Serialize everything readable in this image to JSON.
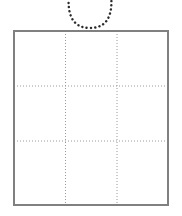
{
  "figure": {
    "type": "line-diagram",
    "title": "",
    "canvas": {
      "width": 182,
      "height": 216,
      "background": "#ffffff"
    },
    "elements": {
      "square": {
        "name": "Square outline",
        "x": 14,
        "y": 31,
        "width": 154,
        "height": 174,
        "stroke": "#808080",
        "stroke_width": 1.6,
        "fill": "none"
      },
      "grid": {
        "name": "Dotted 3x3 grid",
        "rows": 3,
        "columns": 3,
        "stroke": "#9a9a9a",
        "stroke_width": 1,
        "dash": "1 2",
        "vertical_x": [
          65.5,
          117
        ],
        "horizontal_y": [
          86,
          141
        ]
      },
      "arc": {
        "name": "Dotted U-shaped arc",
        "stroke": "#2b2b2b",
        "stroke_width": 2.4,
        "dash": "0.1 4.2",
        "linecap": "round",
        "path": "M 69 -6 C 67 14, 72 28, 90 28 C 108 28, 113 14, 111 -6",
        "left_x": 69,
        "right_x": 111,
        "bottom_y": 28,
        "center_x": 90
      }
    }
  },
  "chart_data": {
    "type": "table",
    "title": "",
    "categories": [
      "col-1",
      "col-2",
      "col-3"
    ],
    "rows": [
      "row-1",
      "row-2",
      "row-3"
    ],
    "values": [
      [
        null,
        null,
        null
      ],
      [
        null,
        null,
        null
      ],
      [
        null,
        null,
        null
      ]
    ],
    "xlabel": "",
    "ylabel": "",
    "legend": [],
    "grid": true,
    "annotations": [
      "dotted U-shaped arc above top edge of grid"
    ]
  }
}
